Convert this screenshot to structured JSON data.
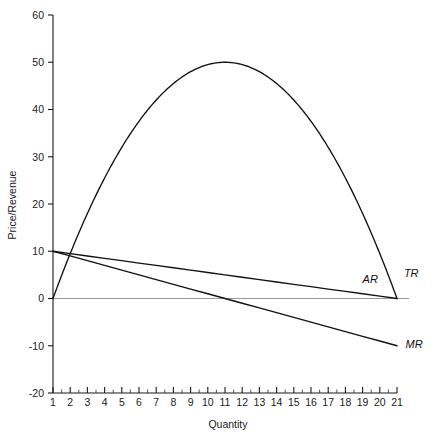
{
  "chart_data": {
    "type": "line",
    "title": "",
    "xlabel": "Quantity",
    "ylabel": "Price/Revenue",
    "xlim": [
      1,
      21
    ],
    "ylim": [
      -20,
      60
    ],
    "grid": false,
    "legend_position": "inline-right",
    "x_ticks": [
      1,
      2,
      3,
      4,
      5,
      6,
      7,
      8,
      9,
      10,
      11,
      12,
      13,
      14,
      15,
      16,
      17,
      18,
      19,
      20,
      21
    ],
    "x_tick_labels": [
      "1",
      "2",
      "3",
      "4",
      "5",
      "6",
      "7",
      "8",
      "9",
      "10",
      "11",
      "12",
      "13",
      "14",
      "15",
      "16",
      "17",
      "18",
      "19",
      "20",
      "21"
    ],
    "x_minor_tick_step": 0.5,
    "y_ticks": [
      -20,
      -10,
      0,
      10,
      20,
      30,
      40,
      50,
      60
    ],
    "y_tick_labels": [
      "-20",
      "-10",
      "0",
      "10",
      "20",
      "30",
      "40",
      "50",
      "60"
    ],
    "zero_line": 0,
    "x": [
      1,
      2,
      3,
      4,
      5,
      6,
      7,
      8,
      9,
      10,
      11,
      12,
      13,
      14,
      15,
      16,
      17,
      18,
      19,
      20,
      21
    ],
    "series": [
      {
        "name": "AR",
        "label": "AR",
        "description": "Average revenue (demand curve)",
        "color": "#111111",
        "label_x": 19.0,
        "label_y": 3.2,
        "values": [
          10.0,
          9.5,
          9.0,
          8.5,
          8.0,
          7.5,
          7.0,
          6.5,
          6.0,
          5.5,
          5.0,
          4.5,
          4.0,
          3.5,
          3.0,
          2.5,
          2.0,
          1.5,
          1.0,
          0.5,
          0.0
        ]
      },
      {
        "name": "MR",
        "label": "MR",
        "description": "Marginal revenue",
        "color": "#111111",
        "label_x": 21.5,
        "label_y": -10.5,
        "values": [
          10.0,
          9.0,
          8.0,
          7.0,
          6.0,
          5.0,
          4.0,
          3.0,
          2.0,
          1.0,
          0.0,
          -1.0,
          -2.0,
          -3.0,
          -4.0,
          -5.0,
          -6.0,
          -7.0,
          -8.0,
          -9.0,
          -10.0
        ]
      },
      {
        "name": "TR",
        "label": "TR",
        "description": "Total revenue",
        "color": "#111111",
        "label_x": 21.4,
        "label_y": 4.6,
        "values": [
          0.0,
          9.5,
          18.0,
          25.5,
          32.0,
          37.5,
          42.0,
          45.5,
          48.0,
          49.5,
          50.0,
          49.5,
          48.0,
          45.5,
          42.0,
          37.5,
          32.0,
          25.5,
          18.0,
          9.5,
          0.0
        ]
      }
    ],
    "annotations": [
      {
        "name": "tr-peak",
        "x": 11,
        "y": 50,
        "text": ""
      },
      {
        "name": "mr-zero-crossing",
        "x": 11,
        "y": 0,
        "text": ""
      },
      {
        "name": "ar-zero-crossing",
        "x": 21,
        "y": 0,
        "text": ""
      }
    ]
  }
}
